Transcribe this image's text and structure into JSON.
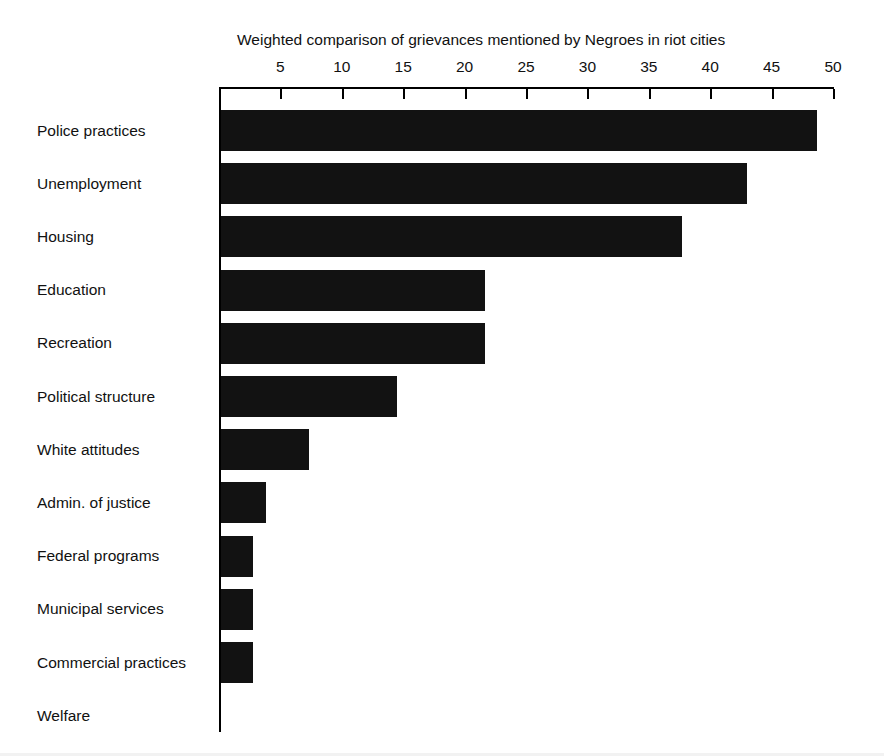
{
  "chart_data": {
    "type": "bar",
    "orientation": "horizontal",
    "title": "Weighted comparison of grievances mentioned by Negroes in riot cities",
    "xlabel": "",
    "ylabel": "",
    "xlim": [
      0,
      50
    ],
    "grid": false,
    "legend": null,
    "axis_position": "top",
    "tick_step": 5,
    "tick_labels": [
      "5",
      "10",
      "15",
      "20",
      "25",
      "30",
      "35",
      "40",
      "45",
      "50"
    ],
    "tick_values": [
      5,
      10,
      15,
      20,
      25,
      30,
      35,
      40,
      45,
      50
    ],
    "categories": [
      "Police practices",
      "Unemployment",
      "Housing",
      "Education",
      "Recreation",
      "Political structure",
      "White attitudes",
      "Admin. of justice",
      "Federal programs",
      "Municipal services",
      "Commercial practices",
      "Welfare"
    ],
    "values": [
      48.5,
      42.8,
      37.5,
      21.5,
      21.5,
      14.3,
      7.2,
      3.7,
      2.6,
      2.6,
      2.6,
      0
    ],
    "bar_color": "#121212",
    "background_color": "#ffffff"
  },
  "axis": {
    "origin_value": 0,
    "max_value": 50
  }
}
